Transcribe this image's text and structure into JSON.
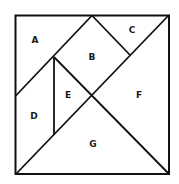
{
  "diagram": {
    "type": "tangram",
    "stroke_color": "#111111",
    "background": "#ffffff",
    "pieces": [
      {
        "id": "A",
        "label": "A"
      },
      {
        "id": "B",
        "label": "B"
      },
      {
        "id": "C",
        "label": "C"
      },
      {
        "id": "D",
        "label": "D"
      },
      {
        "id": "E",
        "label": "E"
      },
      {
        "id": "F",
        "label": "F"
      },
      {
        "id": "G",
        "label": "G"
      }
    ]
  }
}
